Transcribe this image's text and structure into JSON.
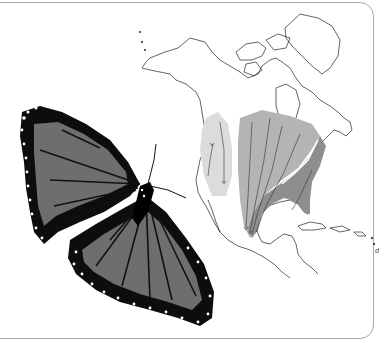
{
  "figure": {
    "subjects": [
      "monarch-butterfly",
      "north-america-map"
    ],
    "map": {
      "regions": [
        {
          "name": "western-population-range",
          "color": "#dcdcdc"
        },
        {
          "name": "eastern-population-range",
          "color": "#b4b4b4"
        },
        {
          "name": "eastern-coastal-range",
          "color": "#8e8e8e"
        }
      ],
      "arrows": "migration-routes-southward",
      "corner_label": "d"
    },
    "colors": {
      "border": "#a8a8a8",
      "wing_fill": "#6e6e6e",
      "wing_veins": "#111111",
      "map_outline": "#222222"
    }
  }
}
